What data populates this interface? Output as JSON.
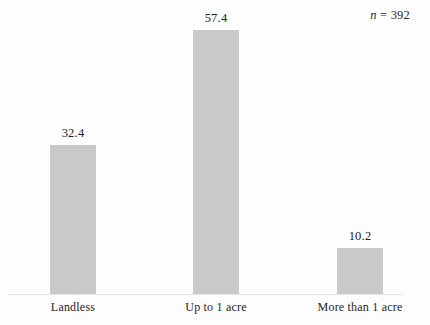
{
  "chart_data": {
    "type": "bar",
    "title": "",
    "subtitle": "",
    "xlabel": "",
    "ylabel": "",
    "categories": [
      "Landless",
      "Up to 1 acre",
      "More than 1 acre"
    ],
    "values": [
      32.4,
      57.4,
      10.2
    ],
    "value_labels": [
      "32.4",
      "57.4",
      "10.2"
    ],
    "ylim": [
      0,
      57.4
    ],
    "grid": false,
    "legend": null,
    "legend_position": "none",
    "annotations": [
      {
        "name": "sample-size",
        "symbol": "n",
        "equals": "=",
        "value": "392",
        "text": "n = 392",
        "position": "top-right"
      }
    ],
    "bar_color": "#c9c9c9",
    "axis_color": "#e4e4e4",
    "text_color": "#222222",
    "background_color": "#fdfdfd"
  },
  "figure": {
    "sample_size": {
      "symbol": "n",
      "separator": "=",
      "value": "392"
    },
    "bars": [
      {
        "label": "Landless",
        "value_label": "32.4"
      },
      {
        "label": "Up to 1 acre",
        "value_label": "57.4"
      },
      {
        "label": "More than 1 acre",
        "value_label": "10.2"
      }
    ]
  }
}
